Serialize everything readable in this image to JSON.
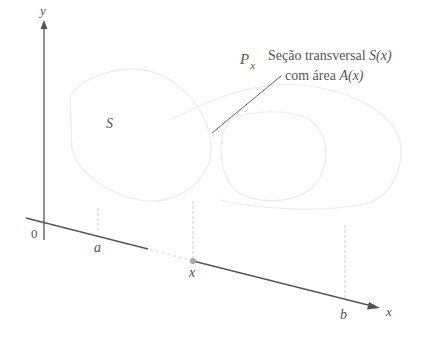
{
  "labels": {
    "y_axis": "y",
    "x_axis": "x",
    "origin": "0",
    "a": "a",
    "b": "b",
    "x_point": "x",
    "solid": "S",
    "plane": "P",
    "plane_sub": "x",
    "cross_section_line1": "Seção transversal ",
    "cross_section_line1_math": "S(x)",
    "cross_section_line2": "com área ",
    "cross_section_line2_math": "A(x)"
  },
  "colors": {
    "axis": "#555555",
    "dashed": "#bbbbbb",
    "solid_outline": "#e6e6e6",
    "point": "#999999"
  }
}
